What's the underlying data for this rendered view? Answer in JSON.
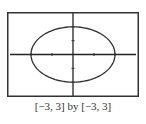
{
  "chart_data": {
    "type": "line",
    "title": "",
    "equation_shape": "circle x^2 + y^2 = 4 (appears elliptical due to non-square window)",
    "xlabel": "",
    "ylabel": "",
    "xlim": [
      -3,
      3
    ],
    "ylim": [
      -3,
      3
    ],
    "x_ticks": [
      -2,
      -1,
      1,
      2
    ],
    "y_ticks": [
      -2,
      -1,
      1,
      2
    ],
    "grid": false,
    "legend": null,
    "series": [
      {
        "name": "curve",
        "x": [
          2,
          1.732,
          1,
          0,
          -1,
          -1.732,
          -2,
          -1.732,
          -1,
          0,
          1,
          1.732,
          2
        ],
        "y": [
          0,
          1,
          1.732,
          2,
          1.732,
          1,
          0,
          -1,
          -1.732,
          -2,
          -1.732,
          -1,
          0
        ]
      }
    ],
    "caption": "[−3, 3] by [−3, 3]"
  },
  "caption": "[−3, 3] by [−3, 3]",
  "colors": {
    "frame": "#333333",
    "axis": "#222222",
    "curve": "#333333"
  }
}
